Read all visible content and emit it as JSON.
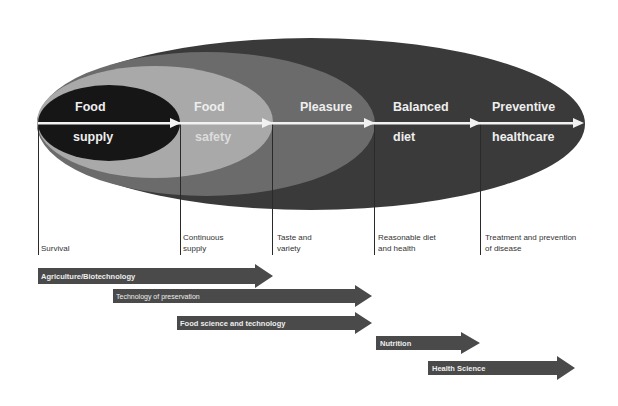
{
  "colors": {
    "outer_ellipse": "#3a3a3a",
    "second_ellipse": "#6b6b6b",
    "third_ellipse": "#a9a9a9",
    "inner_ellipse": "#161616",
    "axis_arrow": "#f2f2f2",
    "band_arrow": "#4a4a4a",
    "milestone_line": "#2a2a2a"
  },
  "stages": [
    {
      "line1": "Food",
      "line2": "supply"
    },
    {
      "line1": "Food",
      "line2": "safety"
    },
    {
      "line1": "Pleasure",
      "line2": ""
    },
    {
      "line1": "Balanced",
      "line2": "diet"
    },
    {
      "line1": "Preventive",
      "line2": "healthcare"
    }
  ],
  "milestones": [
    {
      "line1": "",
      "line2": "Survival"
    },
    {
      "line1": "Continuous",
      "line2": "supply"
    },
    {
      "line1": "Taste and",
      "line2": "variety"
    },
    {
      "line1": "Reasonable diet",
      "line2": "and health"
    },
    {
      "line1": "Treatment and prevention",
      "line2": "of disease"
    }
  ],
  "bands": [
    {
      "label": "Agriculture/Biotechnology"
    },
    {
      "label": "Technology of preservation"
    },
    {
      "label": "Food science and technology"
    },
    {
      "label": "Nutrition"
    },
    {
      "label": "Health Science"
    }
  ]
}
